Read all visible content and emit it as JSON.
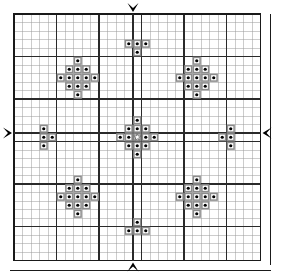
{
  "canvas": {
    "width": 288,
    "height": 280,
    "background": "#ffffff"
  },
  "grid": {
    "origin_x": 14,
    "origin_y": 14,
    "cell": 8.5,
    "cols": 29,
    "rows": 29,
    "thin_color": "#9a9a9a",
    "thin_width": 0.5,
    "heavy_color": "#2a2a2a",
    "heavy_width": 1.4,
    "heavy_every": 5,
    "border_color": "#1a1a1a",
    "border_width": 1.6,
    "outer_rule_col": 29,
    "outer_rule_row": 29,
    "label": "29 by 29 stitch grid with bold rule every 5 squares"
  },
  "symbols": {
    "stitch": {
      "name": "filled-dot-square",
      "cell_fill": "#ffffff",
      "cell_stroke": "#8c8c8c",
      "cell_stroke_width": 1.5,
      "dot_color": "#000000",
      "dot_radius": 1.6
    },
    "center_mark": {
      "name": "star-outline",
      "stroke": "#6f6f6f",
      "fill": "#ffffff",
      "points": 5
    }
  },
  "axes": {
    "center_col": 14,
    "center_row": 14,
    "line_color": "#2a2a2a",
    "line_width": 1.6,
    "arrows": [
      {
        "name": "center-marker-top",
        "direction": "down",
        "col": 14,
        "edge": "top"
      },
      {
        "name": "center-marker-bottom",
        "direction": "up",
        "col": 14,
        "edge": "bottom"
      },
      {
        "name": "center-marker-left",
        "direction": "right",
        "row": 14,
        "edge": "left"
      },
      {
        "name": "center-marker-right",
        "direction": "left",
        "row": 14,
        "edge": "right"
      }
    ],
    "arrow_color": "#000000"
  },
  "chart_data": {
    "type": "heatmap",
    "subtitle": "Symmetric snowflake / diamond motif sampler",
    "xlabel": "",
    "ylabel": "",
    "grid": true,
    "legend": "none",
    "xlim": [
      0,
      29
    ],
    "ylim": [
      0,
      29
    ],
    "categories": [
      "empty",
      "stitch",
      "center-star"
    ],
    "values_note": "Each entry is a stitched square at [col,row], zero indexed from top-left of the 29x29 grid.",
    "motifs": [
      {
        "name": "center-diamond",
        "shape": "diamond-1-3-5-3-1",
        "center": [
          14,
          14
        ],
        "cells": [
          [
            14,
            12
          ],
          [
            13,
            13
          ],
          [
            14,
            13
          ],
          [
            15,
            13
          ],
          [
            12,
            14
          ],
          [
            13,
            14
          ],
          [
            14,
            14
          ],
          [
            15,
            14
          ],
          [
            16,
            14
          ],
          [
            13,
            15
          ],
          [
            14,
            15
          ],
          [
            15,
            15
          ],
          [
            14,
            16
          ]
        ],
        "star_cell": [
          14,
          14
        ]
      },
      {
        "name": "top-left-diamond",
        "shape": "diamond-1-3-5-3-1",
        "center": [
          7,
          7
        ],
        "cells": [
          [
            7,
            5
          ],
          [
            6,
            6
          ],
          [
            7,
            6
          ],
          [
            8,
            6
          ],
          [
            5,
            7
          ],
          [
            6,
            7
          ],
          [
            7,
            7
          ],
          [
            8,
            7
          ],
          [
            9,
            7
          ],
          [
            6,
            8
          ],
          [
            7,
            8
          ],
          [
            8,
            8
          ],
          [
            7,
            9
          ]
        ]
      },
      {
        "name": "top-right-diamond",
        "shape": "diamond-1-3-5-3-1",
        "center": [
          21,
          7
        ],
        "cells": [
          [
            21,
            5
          ],
          [
            20,
            6
          ],
          [
            21,
            6
          ],
          [
            22,
            6
          ],
          [
            19,
            7
          ],
          [
            20,
            7
          ],
          [
            21,
            7
          ],
          [
            22,
            7
          ],
          [
            23,
            7
          ],
          [
            20,
            8
          ],
          [
            21,
            8
          ],
          [
            22,
            8
          ],
          [
            21,
            9
          ]
        ]
      },
      {
        "name": "bottom-left-diamond",
        "shape": "diamond-1-3-5-3-1",
        "center": [
          7,
          21
        ],
        "cells": [
          [
            7,
            19
          ],
          [
            6,
            20
          ],
          [
            7,
            20
          ],
          [
            8,
            20
          ],
          [
            5,
            21
          ],
          [
            6,
            21
          ],
          [
            7,
            21
          ],
          [
            8,
            21
          ],
          [
            9,
            21
          ],
          [
            6,
            22
          ],
          [
            7,
            22
          ],
          [
            8,
            22
          ],
          [
            7,
            23
          ]
        ]
      },
      {
        "name": "bottom-right-diamond",
        "shape": "diamond-1-3-5-3-1",
        "center": [
          21,
          21
        ],
        "cells": [
          [
            21,
            19
          ],
          [
            20,
            20
          ],
          [
            21,
            20
          ],
          [
            22,
            20
          ],
          [
            19,
            21
          ],
          [
            20,
            21
          ],
          [
            21,
            21
          ],
          [
            22,
            21
          ],
          [
            23,
            21
          ],
          [
            20,
            22
          ],
          [
            21,
            22
          ],
          [
            22,
            22
          ],
          [
            21,
            23
          ]
        ]
      },
      {
        "name": "top-edge-motif",
        "shape": "tee-pointing-down",
        "cells": [
          [
            13,
            3
          ],
          [
            14,
            3
          ],
          [
            15,
            3
          ],
          [
            14,
            4
          ]
        ]
      },
      {
        "name": "bottom-edge-motif",
        "shape": "tee-pointing-up",
        "cells": [
          [
            14,
            24
          ],
          [
            13,
            25
          ],
          [
            14,
            25
          ],
          [
            15,
            25
          ]
        ]
      },
      {
        "name": "left-edge-motif",
        "shape": "tee-pointing-right",
        "cells": [
          [
            3,
            13
          ],
          [
            3,
            14
          ],
          [
            4,
            14
          ],
          [
            3,
            15
          ]
        ]
      },
      {
        "name": "right-edge-motif",
        "shape": "tee-pointing-left",
        "cells": [
          [
            25,
            13
          ],
          [
            24,
            14
          ],
          [
            25,
            14
          ],
          [
            25,
            15
          ]
        ]
      }
    ],
    "total_stitches": 86
  }
}
